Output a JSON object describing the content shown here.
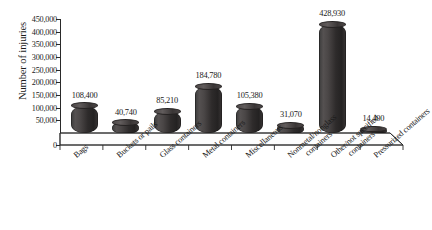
{
  "chart_data": {
    "type": "bar",
    "title": "",
    "xlabel": "",
    "ylabel": "Number of injuries",
    "ylim": [
      0,
      450000
    ],
    "ytick_step": 50000,
    "grid": false,
    "legend": "none",
    "bar_style": "3d-cylinder",
    "bar_color": "#3a3636",
    "categories": [
      "Bags",
      "Buckets or pails",
      "Glass containers",
      "Metal containers",
      "Miscellaneous",
      "Nonmetal/nonglass containers",
      "Other/not specified containers",
      "Pressurized containers"
    ],
    "category_lines": [
      [
        "Bags"
      ],
      [
        "Buckets or pails"
      ],
      [
        "Glass containers"
      ],
      [
        "Metal containers"
      ],
      [
        "Miscellaneous"
      ],
      [
        "Nonmetal/nonglass",
        "containers"
      ],
      [
        "Other/not specified",
        "containers"
      ],
      [
        "Pressurized containers"
      ]
    ],
    "values": [
      108400,
      40740,
      85210,
      184780,
      105380,
      31070,
      428930,
      14400
    ],
    "value_labels": [
      "108,400",
      "40,740",
      "85,210",
      "184,780",
      "105,380",
      "31,070",
      "428,930",
      "14,400"
    ],
    "ytick_labels": [
      "0",
      "50,000",
      "100,000",
      "150,000",
      "200,000",
      "250,000",
      "300,000",
      "350,000",
      "400,000",
      "450,000"
    ],
    "ytick_values": [
      0,
      50000,
      100000,
      150000,
      200000,
      250000,
      300000,
      350000,
      400000,
      450000
    ]
  }
}
